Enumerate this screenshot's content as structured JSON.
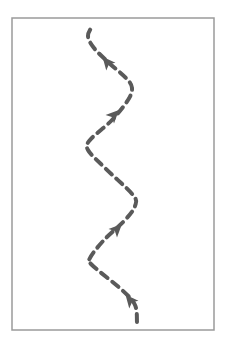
{
  "diagram": {
    "type": "dashed-zigzag-path",
    "frame": {
      "x": 12,
      "y": 18,
      "width": 202,
      "height": 312,
      "stroke": "#9a9a9a"
    },
    "path": {
      "stroke": "#5a5a5a",
      "stroke_width": 4,
      "dash": "8 6",
      "points": [
        [
          137,
          322
        ],
        [
          135,
          305
        ],
        [
          122,
          290
        ],
        [
          92,
          265
        ],
        [
          90,
          258
        ],
        [
          104,
          240
        ],
        [
          125,
          220
        ],
        [
          135,
          206
        ],
        [
          133,
          195
        ],
        [
          105,
          168
        ],
        [
          88,
          150
        ],
        [
          90,
          140
        ],
        [
          112,
          120
        ],
        [
          128,
          100
        ],
        [
          132,
          88
        ],
        [
          126,
          78
        ],
        [
          108,
          62
        ],
        [
          94,
          48
        ],
        [
          88,
          36
        ],
        [
          93,
          25
        ]
      ]
    },
    "arrows": [
      {
        "name": "arrow-1",
        "x": 130,
        "y": 300,
        "angle": -130
      },
      {
        "name": "arrow-2",
        "x": 117,
        "y": 229,
        "angle": -45
      },
      {
        "name": "arrow-3",
        "x": 114,
        "y": 115,
        "angle": -45
      },
      {
        "name": "arrow-4",
        "x": 107,
        "y": 62,
        "angle": -130
      }
    ],
    "arrow_color": "#5a5a5a"
  }
}
